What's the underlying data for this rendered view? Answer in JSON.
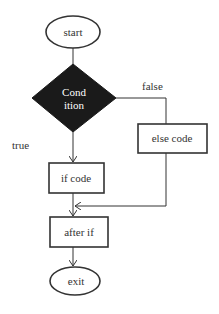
{
  "diagram": {
    "type": "flowchart",
    "nodes": {
      "start": {
        "label": "start",
        "shape": "ellipse"
      },
      "condition": {
        "label_line1": "Cond",
        "label_line2": "ition",
        "shape": "diamond",
        "fill": "#1a1a1a"
      },
      "else_code": {
        "label": "else code",
        "shape": "rectangle"
      },
      "if_code": {
        "label": "if code",
        "shape": "rectangle"
      },
      "after_if": {
        "label": "after if",
        "shape": "rectangle"
      },
      "exit": {
        "label": "exit",
        "shape": "ellipse"
      }
    },
    "edges": [
      {
        "from": "start",
        "to": "condition",
        "label": ""
      },
      {
        "from": "condition",
        "to": "if_code",
        "label": "true"
      },
      {
        "from": "condition",
        "to": "else_code",
        "label": "false"
      },
      {
        "from": "if_code",
        "to": "after_if",
        "label": ""
      },
      {
        "from": "else_code",
        "to": "after_if",
        "label": ""
      },
      {
        "from": "after_if",
        "to": "exit",
        "label": ""
      }
    ],
    "edge_labels": {
      "true": "true",
      "false": "false"
    },
    "colors": {
      "stroke": "#333333",
      "diamond_fill": "#1a1a1a",
      "background": "#ffffff"
    }
  }
}
